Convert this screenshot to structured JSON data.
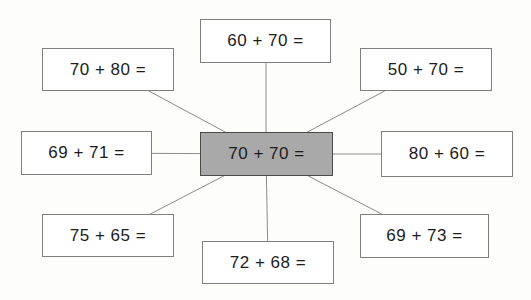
{
  "diagram": {
    "center": {
      "label": "70 + 70 ="
    },
    "nodes": [
      {
        "id": "top-left",
        "label": "70 + 80 ="
      },
      {
        "id": "top-center",
        "label": "60 + 70 ="
      },
      {
        "id": "top-right",
        "label": "50 + 70 ="
      },
      {
        "id": "mid-left",
        "label": "69 + 71 ="
      },
      {
        "id": "mid-right",
        "label": "80 + 60 ="
      },
      {
        "id": "bottom-left",
        "label": "75 + 65 ="
      },
      {
        "id": "bottom-center",
        "label": "72 + 68 ="
      },
      {
        "id": "bottom-right",
        "label": "69 + 73 ="
      }
    ],
    "colors": {
      "center_fill": "#a9a9a9",
      "center_border": "#4a4a4a",
      "node_border": "#7f7f7f",
      "connector_line": "#8a8a8a",
      "text": "#1c1c1c"
    }
  }
}
